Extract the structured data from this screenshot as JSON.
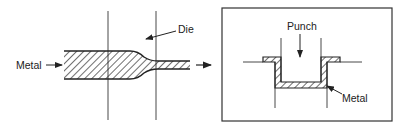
{
  "diagram": {
    "left_panel": {
      "process": "drawing / extrusion through die",
      "labels": {
        "metal": "Metal",
        "die": "Die"
      }
    },
    "right_panel": {
      "process": "deep drawing with punch",
      "labels": {
        "punch": "Punch",
        "metal": "Metal"
      }
    },
    "colors": {
      "line": "#222222",
      "background": "#ffffff"
    }
  }
}
